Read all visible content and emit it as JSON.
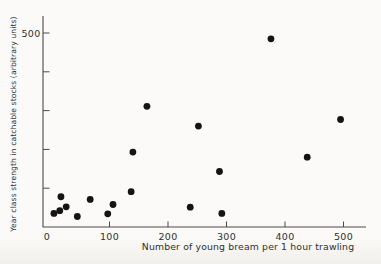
{
  "colors": {
    "background": "#fbfaf8",
    "ink": "#141414",
    "axis": "#4a4a4a",
    "text": "#2f2f2f"
  },
  "chart_data": {
    "type": "scatter",
    "title": "",
    "xlabel": "Number of young bream per 1 hour trawling",
    "ylabel": "Year class strength in catchable stocks (arbitrary units)",
    "xlim": [
      0,
      540
    ],
    "ylim": [
      0,
      545
    ],
    "grid": false,
    "legend": "none",
    "marker": "filled-circle",
    "x_ticks": [
      {
        "value": 0,
        "label": "0"
      },
      {
        "value": 100,
        "label": "100"
      },
      {
        "value": 200,
        "label": "200"
      },
      {
        "value": 300,
        "label": "300"
      },
      {
        "value": 400,
        "label": "400"
      },
      {
        "value": 500,
        "label": "500"
      }
    ],
    "y_ticks": [
      {
        "value": 100,
        "label": ""
      },
      {
        "value": 200,
        "label": ""
      },
      {
        "value": 300,
        "label": ""
      },
      {
        "value": 400,
        "label": ""
      },
      {
        "value": 500,
        "label": "500"
      }
    ],
    "points": [
      {
        "x": 5,
        "y": 35
      },
      {
        "x": 15,
        "y": 42
      },
      {
        "x": 17,
        "y": 78
      },
      {
        "x": 26,
        "y": 52
      },
      {
        "x": 45,
        "y": 27
      },
      {
        "x": 67,
        "y": 71
      },
      {
        "x": 97,
        "y": 34
      },
      {
        "x": 106,
        "y": 58
      },
      {
        "x": 137,
        "y": 91
      },
      {
        "x": 140,
        "y": 193
      },
      {
        "x": 164,
        "y": 311
      },
      {
        "x": 238,
        "y": 51
      },
      {
        "x": 252,
        "y": 260
      },
      {
        "x": 288,
        "y": 143
      },
      {
        "x": 292,
        "y": 35
      },
      {
        "x": 376,
        "y": 485
      },
      {
        "x": 438,
        "y": 180
      },
      {
        "x": 495,
        "y": 277
      }
    ]
  }
}
